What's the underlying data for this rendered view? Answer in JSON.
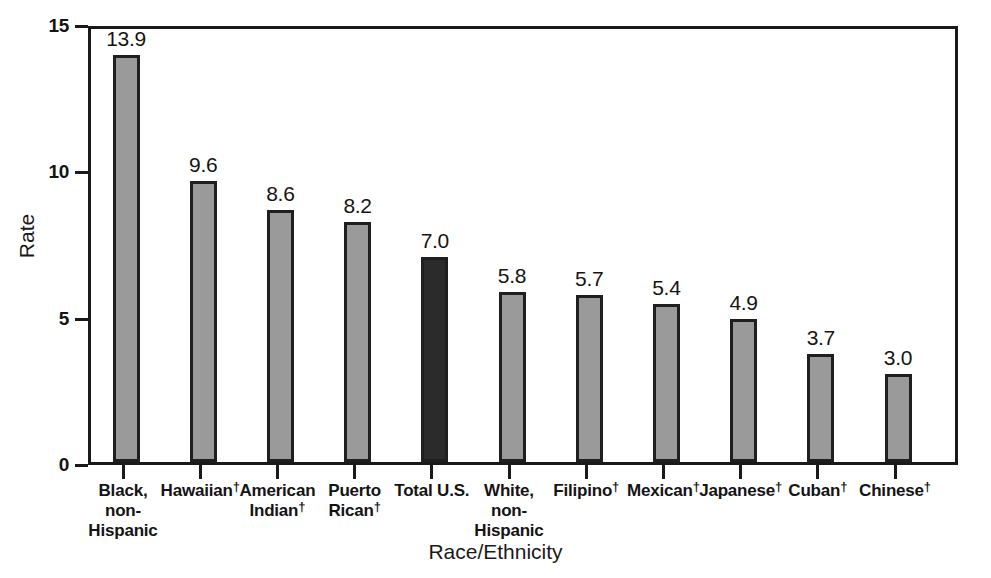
{
  "chart_data": {
    "type": "bar",
    "title": "",
    "xlabel": "Race/Ethnicity",
    "ylabel": "Rate",
    "ylim": [
      0,
      15
    ],
    "yticks": [
      "0",
      "5",
      "10",
      "15"
    ],
    "ytick_values": [
      0,
      5,
      10,
      15
    ],
    "grid": false,
    "legend": "none",
    "categories": [
      "Black, non-Hispanic",
      "Hawaiian†",
      "American Indian†",
      "Puerto Rican†",
      "Total U.S.",
      "White, non-Hispanic",
      "Filipino†",
      "Mexican†",
      "Japanese†",
      "Cuban†",
      "Chinese†"
    ],
    "category_lines": [
      [
        "Black,",
        "non-",
        "Hispanic"
      ],
      [
        "Hawaiian†"
      ],
      [
        "American",
        "Indian†"
      ],
      [
        "Puerto",
        "Rican†"
      ],
      [
        "Total U.S."
      ],
      [
        "White,",
        "non-",
        "Hispanic"
      ],
      [
        "Filipino†"
      ],
      [
        "Mexican†"
      ],
      [
        "Japanese†"
      ],
      [
        "Cuban†"
      ],
      [
        "Chinese†"
      ]
    ],
    "values": [
      13.9,
      9.6,
      8.6,
      8.2,
      7.0,
      5.8,
      5.7,
      5.4,
      4.9,
      3.7,
      3.0
    ],
    "value_labels": [
      "13.9",
      "9.6",
      "8.6",
      "8.2",
      "7.0",
      "5.8",
      "5.7",
      "5.4",
      "4.9",
      "3.7",
      "3.0"
    ],
    "highlight_index": 4,
    "colors": {
      "bar_fill": "#9a9a9a",
      "bar_highlight_fill": "#2b2b2b",
      "bar_border": "#1f1f1f",
      "axis": "#1a1a1a",
      "text": "#141414",
      "background": "#ffffff"
    }
  }
}
